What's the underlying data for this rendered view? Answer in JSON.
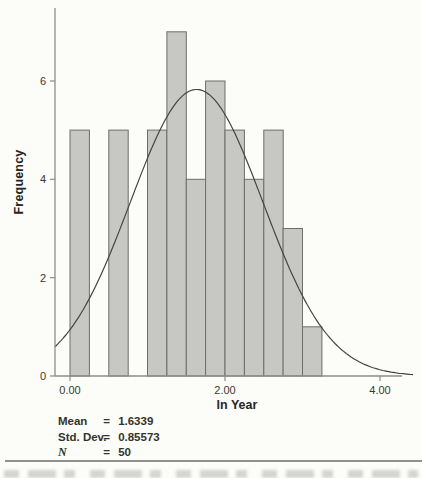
{
  "chart_data": {
    "type": "histogram",
    "title": "",
    "xlabel": "ln Year",
    "ylabel": "Frequency",
    "bin_start": 0.0,
    "bin_width": 0.25,
    "bin_categories": [
      "0.00-0.25",
      "0.25-0.50",
      "0.50-0.75",
      "0.75-1.00",
      "1.00-1.25",
      "1.25-1.50",
      "1.50-1.75",
      "1.75-2.00",
      "2.00-2.25",
      "2.25-2.50",
      "2.50-2.75",
      "2.75-3.00",
      "3.00-3.25"
    ],
    "counts": [
      5,
      0,
      5,
      0,
      5,
      7,
      4,
      6,
      5,
      4,
      5,
      3,
      1
    ],
    "x_ticks": [
      {
        "v": 0,
        "label": "0.00"
      },
      {
        "v": 2,
        "label": "2.00"
      },
      {
        "v": 4,
        "label": "4.00"
      }
    ],
    "y_ticks": [
      {
        "v": 0,
        "label": "0"
      },
      {
        "v": 2,
        "label": "2"
      },
      {
        "v": 4,
        "label": "4"
      },
      {
        "v": 6,
        "label": "6"
      }
    ],
    "xlim": [
      -0.2,
      4.43
    ],
    "ylim": [
      0,
      7.5
    ],
    "grid": false,
    "legend": "none",
    "normal_curve": {
      "mean": 1.6339,
      "sd": 0.85573,
      "n": 50,
      "peak_height": 5.83
    }
  },
  "stats": {
    "rows": [
      {
        "label": "Mean",
        "eq": "=",
        "value": "1.6339"
      },
      {
        "label": "Std. Dev.",
        "eq": "=",
        "value": "0.85573"
      },
      {
        "label": "N",
        "eq": "=",
        "value": "50"
      }
    ]
  },
  "colors": {
    "bar_fill": "#c7c7c4",
    "bar_stroke": "#6d6d6a",
    "axis": "#8d8d8a",
    "curve": "#45453f",
    "tick_text": "#39392f",
    "label_text": "#26261e",
    "stats_text": "#33332b",
    "divider": "#8f8f8d"
  }
}
